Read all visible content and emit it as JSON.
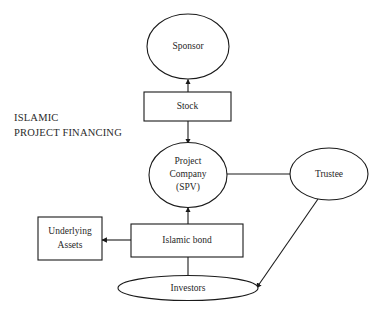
{
  "canvas": {
    "width": 378,
    "height": 315,
    "background": "#ffffff",
    "stroke_color": "#1a1a1a",
    "text_color": "#1f1f1f"
  },
  "section_label": {
    "line1": "ISLAMIC",
    "line2": "PROJECT FINANCING"
  },
  "nodes": {
    "sponsor": {
      "label": "Sponsor",
      "shape": "ellipse"
    },
    "stock": {
      "label": "Stock",
      "shape": "rectangle"
    },
    "project_company": {
      "line1": "Project",
      "line2": "Company",
      "line3": "(SPV)",
      "shape": "ellipse"
    },
    "trustee": {
      "label": "Trustee",
      "shape": "ellipse"
    },
    "underlying_assets": {
      "line1": "Underlying",
      "line2": "Assets",
      "shape": "rectangle"
    },
    "islamic_bond": {
      "label": "Islamic bond",
      "shape": "rectangle"
    },
    "investors": {
      "label": "Investors",
      "shape": "ellipse"
    }
  },
  "edges": [
    {
      "name": "stock-to-sponsor",
      "from": "stock",
      "to": "sponsor",
      "arrow": "to"
    },
    {
      "name": "stock-to-project-company",
      "from": "stock",
      "to": "project_company",
      "arrow": "to"
    },
    {
      "name": "project-company-to-trustee",
      "from": "project_company",
      "to": "trustee",
      "arrow": "none"
    },
    {
      "name": "islamic-bond-to-project-company",
      "from": "islamic_bond",
      "to": "project_company",
      "arrow": "to"
    },
    {
      "name": "islamic-bond-to-underlying-assets",
      "from": "islamic_bond",
      "to": "underlying_assets",
      "arrow": "to"
    },
    {
      "name": "islamic-bond-to-investors",
      "from": "islamic_bond",
      "to": "investors",
      "arrow": "none"
    },
    {
      "name": "trustee-to-investors",
      "from": "trustee",
      "to": "investors",
      "arrow": "to"
    }
  ]
}
